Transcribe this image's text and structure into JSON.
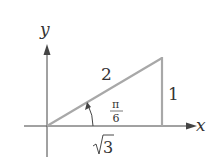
{
  "diagram": {
    "type": "right-triangle-unit-circle",
    "axes": {
      "x_label": "x",
      "y_label": "y"
    },
    "sides": {
      "hypotenuse": "2",
      "opposite": "1",
      "adjacent": "√3"
    },
    "angle": {
      "numerator": "π",
      "denominator": "6"
    },
    "colors": {
      "triangle": "#a8a8a8",
      "axes": "#444444",
      "text": "#333333"
    }
  }
}
